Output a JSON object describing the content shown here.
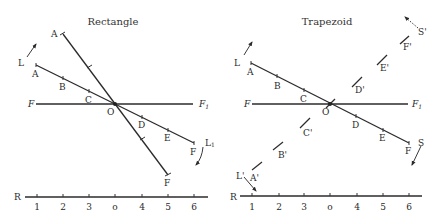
{
  "panels": [
    {
      "title": "Rectangle",
      "labels": {
        "A_upper": "A",
        "A_lower": "A",
        "B": "B",
        "C": "C",
        "O": "O",
        "D": "D",
        "E": "E",
        "F_right": "F",
        "F_bottom": "F",
        "F_axis_left": "F",
        "F_axis_right": "F",
        "F_axis_right_sub": "1",
        "L": "L",
        "L1": "L",
        "L1_sub": "1"
      },
      "ruler": {
        "label": "R",
        "ticks": [
          "1",
          "2",
          "3",
          "o",
          "4",
          "5",
          "6"
        ]
      }
    },
    {
      "title": "Trapezoid",
      "labels": {
        "A": "A",
        "B": "B",
        "C": "C",
        "O": "O",
        "D": "D",
        "E": "E",
        "F": "F",
        "F_axis_left": "F",
        "F_axis_right": "F",
        "F_axis_right_sub": "1",
        "L": "L",
        "S": "S",
        "A_prime": "A'",
        "B_prime": "B'",
        "C_prime": "C'",
        "D_prime": "D'",
        "E_prime": "E'",
        "F_prime": "F'",
        "S_prime": "S'",
        "L_prime": "L'"
      },
      "ruler": {
        "label": "R",
        "ticks": [
          "1",
          "2",
          "3",
          "o",
          "4",
          "5",
          "6"
        ]
      }
    }
  ]
}
